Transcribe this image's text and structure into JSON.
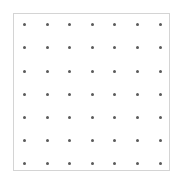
{
  "grid": {
    "rows": 7,
    "cols": 7,
    "dot_color": "#5a5a5a",
    "border_color": "#d4d4d4",
    "background": "#ffffff",
    "x_positions": [
      24,
      47,
      69,
      92,
      114,
      137,
      160
    ],
    "y_positions": [
      24,
      47,
      71,
      94,
      117,
      140,
      163
    ]
  }
}
